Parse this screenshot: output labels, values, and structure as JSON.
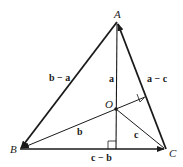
{
  "diagram": {
    "points": {
      "A": {
        "label": "A",
        "x": 117,
        "y": 22
      },
      "B": {
        "label": "B",
        "x": 20,
        "y": 149
      },
      "C": {
        "label": "C",
        "x": 166,
        "y": 149
      },
      "O": {
        "label": "O",
        "x": 116,
        "y": 109
      }
    },
    "vector_labels": {
      "b_minus_a": "b − a",
      "a_minus_c": "a − c",
      "a": "a",
      "b": "b",
      "c": "c",
      "c_minus_b": "c − b"
    },
    "colors": {
      "stroke": "#1a1a1a",
      "background": "#ffffff"
    }
  }
}
